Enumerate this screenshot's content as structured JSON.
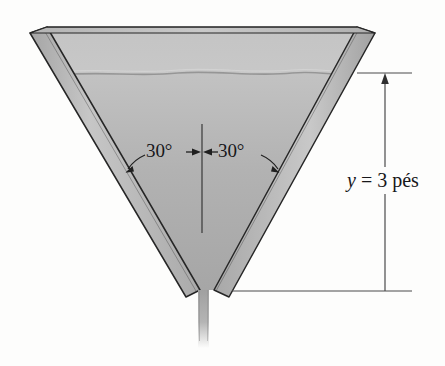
{
  "figure": {
    "name": "v-notch-weir-cross-section",
    "background_color": "#fdfdfc"
  },
  "annotations": {
    "angle_left": "30°",
    "angle_right": "30°",
    "depth_symbol": "y",
    "depth_equals": " = ",
    "depth_value": "3 pés",
    "depth_full": "y = 3 pés"
  },
  "colors": {
    "wall_band_light": "#bdbdbd",
    "wall_band_dark": "#949494",
    "interior_upper": "#cbcbcb",
    "interior_fluid": "#b4b4b4",
    "outline": "#2b2b2b",
    "dimension_line": "#4a4a4a",
    "stream": "#a8a8a8",
    "text": "#17171a"
  },
  "geometry": {
    "vertex_angle_total_deg": 60,
    "half_angle_deg": 30,
    "fluid_depth_feet": 3
  }
}
